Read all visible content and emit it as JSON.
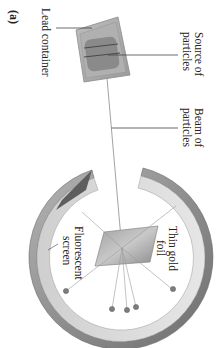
{
  "figure": {
    "panel_label": "(a)",
    "orientation": "rotated 90deg clockwise",
    "labels": {
      "lead_container": "Lead container",
      "source_line1": "Source of",
      "source_line2": "particles",
      "beam_line1": "Beam of",
      "beam_line2": "particles",
      "foil_line1": "Thin gold",
      "foil_line2": "foil",
      "screen_line1": "Fluorescent",
      "screen_line2": "screen"
    },
    "colors": {
      "background": "#ffffff",
      "text": "#222222",
      "lead_box": "#a8a8a8",
      "source_block": "#7a7a7a",
      "screen_ring_outer": "#8c8c8c",
      "screen_ring_inner": "#d8d8d8",
      "foil": "#9a9a9a",
      "beam": "#8a8a8a",
      "spot": "#7d7d7d"
    }
  }
}
